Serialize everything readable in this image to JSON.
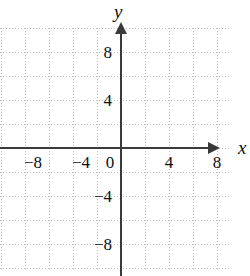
{
  "figure": {
    "type": "coordinate-plane",
    "axis_labels": {
      "x": "x",
      "y": "y"
    },
    "origin_label": "0",
    "x_ticks": [
      "−8",
      "−4",
      "0",
      "4",
      "8"
    ],
    "y_ticks": [
      "8",
      "4",
      "−4",
      "−8"
    ],
    "colors": {
      "background": "#ffffff",
      "axis": "#3a3a3a",
      "grid": "#bdbdbd",
      "text": "#111111"
    }
  },
  "chart_data": {
    "type": "scatter",
    "title": "",
    "xlabel": "x",
    "ylabel": "y",
    "x": [],
    "y": [],
    "series": [],
    "xlim": [
      -10,
      9
    ],
    "ylim": [
      -10,
      10
    ],
    "xticks": [
      -8,
      -4,
      0,
      4,
      8
    ],
    "yticks": [
      8,
      4,
      -4,
      -8
    ],
    "xtick_labels": [
      "−8",
      "−4",
      "0",
      "4",
      "8"
    ],
    "ytick_labels": [
      "8",
      "4",
      "−4",
      "−8"
    ],
    "grid": true,
    "grid_style": "dotted",
    "grid_step": 2,
    "legend": null,
    "annotations": [],
    "note": "Empty Cartesian grid with no plotted data"
  }
}
